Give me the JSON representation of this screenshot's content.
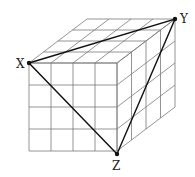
{
  "diagram": {
    "type": "cube-grid",
    "grid_divisions": 4,
    "front_origin": [
      29,
      63
    ],
    "cell_size": 22,
    "depth_offset": [
      58,
      -44
    ],
    "points": {
      "X": {
        "label": "X",
        "pos": [
          29,
          63
        ],
        "label_pos": [
          16,
          68
        ]
      },
      "Y": {
        "label": "Y",
        "pos": [
          175,
          19
        ],
        "label_pos": [
          180,
          23
        ]
      },
      "Z": {
        "label": "Z",
        "pos": [
          117,
          154
        ],
        "label_pos": [
          112,
          170
        ]
      }
    },
    "triangle": [
      "X",
      "Y",
      "Z"
    ],
    "colors": {
      "grid": "#7a7a7a",
      "triangle": "#111111"
    }
  }
}
